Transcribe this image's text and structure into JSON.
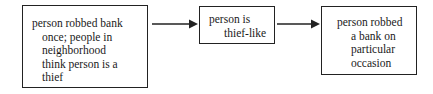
{
  "diagram": {
    "nodes": [
      {
        "id": "premise",
        "lines": [
          "person robbed bank",
          "once; people in",
          "neighborhood",
          "think person is a",
          "thief"
        ]
      },
      {
        "id": "intermediate",
        "lines": [
          "person is",
          "thief-like"
        ]
      },
      {
        "id": "conclusion",
        "lines": [
          "person robbed",
          "a bank on",
          "particular",
          "occasion"
        ]
      }
    ],
    "edges": [
      {
        "from": "premise",
        "to": "intermediate"
      },
      {
        "from": "intermediate",
        "to": "conclusion"
      }
    ],
    "colors": {
      "stroke": "#222222",
      "text": "#1a1a1a",
      "background": "#ffffff"
    }
  }
}
